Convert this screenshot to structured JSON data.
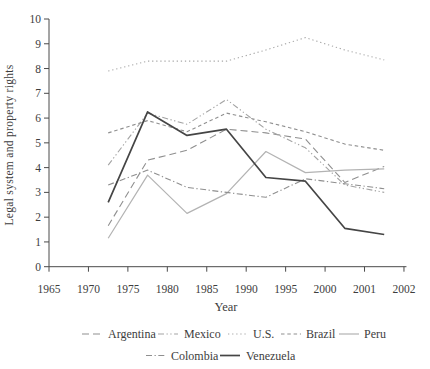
{
  "chart_data": {
    "type": "line",
    "title": "",
    "xlabel": "Year",
    "ylabel": "Legal system and property rights",
    "ylim": [
      0,
      10
    ],
    "y_ticks": [
      0,
      1,
      2,
      3,
      4,
      5,
      6,
      7,
      8,
      9,
      10
    ],
    "x_tick_labels": [
      "1965",
      "1970",
      "1975",
      "1980",
      "1985",
      "1990",
      "1995",
      "2000",
      "2001",
      "2002"
    ],
    "x_positions_tick_units": [
      1.5,
      2.5,
      3.5,
      4.5,
      5.5,
      6.5,
      7.5,
      8.5
    ],
    "grid": false,
    "legend_position": "bottom",
    "axis_color": "#4a4a4a",
    "text_color": "#3d3d3d",
    "series": [
      {
        "name": "Argentina",
        "color": "#8f8f8f",
        "dash": "7,4",
        "width": 1.1,
        "values": [
          1.65,
          4.3,
          4.7,
          5.55,
          5.4,
          5.15,
          3.4,
          4.05
        ]
      },
      {
        "name": "Mexico",
        "color": "#a3a3a3",
        "dash": "6,2.5,1.3,2.5,1.3,2.5",
        "width": 1.1,
        "values": [
          4.1,
          6.2,
          5.75,
          6.75,
          5.55,
          4.8,
          3.3,
          3.0
        ]
      },
      {
        "name": "U.S.",
        "color": "#a8a8a8",
        "dash": "1.3,2.8",
        "width": 1.1,
        "values": [
          7.9,
          8.3,
          8.3,
          8.3,
          8.75,
          9.25,
          8.75,
          8.35
        ]
      },
      {
        "name": "Brazil",
        "color": "#8f8f8f",
        "dash": "3.5,2.8",
        "width": 1.1,
        "values": [
          5.4,
          5.9,
          5.45,
          6.2,
          5.85,
          5.45,
          4.95,
          4.7
        ]
      },
      {
        "name": "Peru",
        "color": "#b3b3b3",
        "dash": "",
        "width": 1.2,
        "values": [
          1.15,
          3.7,
          2.15,
          2.95,
          4.65,
          3.8,
          3.9,
          3.95
        ]
      },
      {
        "name": "Colombia",
        "color": "#8f8f8f",
        "dash": "6,2.5,1.3,2.5",
        "width": 1.1,
        "values": [
          3.3,
          3.9,
          3.2,
          3.0,
          2.8,
          3.55,
          3.35,
          3.15
        ]
      },
      {
        "name": "Venezuela",
        "color": "#454545",
        "dash": "",
        "width": 1.7,
        "values": [
          2.6,
          6.25,
          5.3,
          5.55,
          3.6,
          3.45,
          1.55,
          1.3
        ]
      }
    ],
    "legend_rows": [
      [
        "Argentina",
        "Mexico",
        "U.S.",
        "Brazil",
        "Peru"
      ],
      [
        "Colombia",
        "Venezuela"
      ]
    ]
  }
}
